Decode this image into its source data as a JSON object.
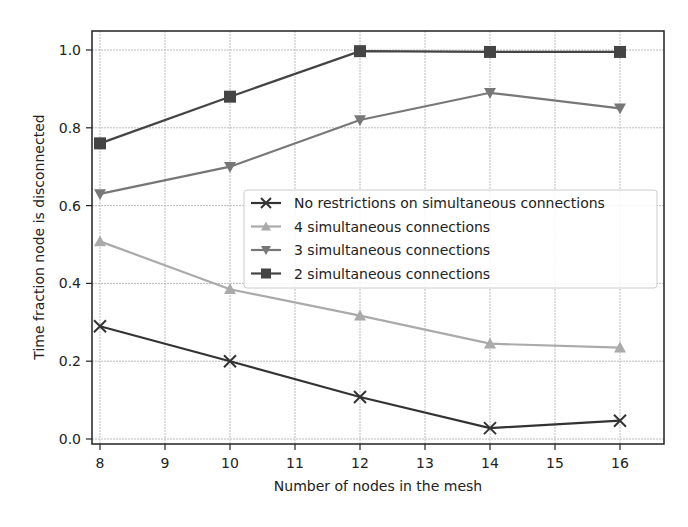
{
  "chart_data": {
    "type": "line",
    "title": "",
    "xlabel": "Number of nodes in the mesh",
    "ylabel": "Time fraction node is disconnected",
    "x": [
      8,
      10,
      12,
      14,
      16
    ],
    "xlim": [
      7.85,
      16.8
    ],
    "ylim": [
      -0.015,
      1.05
    ],
    "xticks": [
      8,
      9,
      10,
      11,
      12,
      13,
      14,
      15,
      16
    ],
    "yticks": [
      0.0,
      0.2,
      0.4,
      0.6,
      0.8,
      1.0
    ],
    "xtick_labels": [
      "8",
      "9",
      "10",
      "11",
      "12",
      "13",
      "14",
      "15",
      "16"
    ],
    "ytick_labels": [
      "0.0",
      "0.2",
      "0.4",
      "0.6",
      "0.8",
      "1.0"
    ],
    "grid": true,
    "legend_position": "center right",
    "series": [
      {
        "name": "No restrictions on simultaneous connections",
        "marker": "x",
        "color": "#333333",
        "values": [
          0.29,
          0.2,
          0.108,
          0.028,
          0.047
        ]
      },
      {
        "name": "4 simultaneous connections",
        "marker": "triangle-up",
        "color": "#aaaaaa",
        "values": [
          0.508,
          0.385,
          0.317,
          0.245,
          0.235
        ]
      },
      {
        "name": "3 simultaneous connections",
        "marker": "triangle-down",
        "color": "#777777",
        "values": [
          0.63,
          0.7,
          0.82,
          0.89,
          0.85
        ]
      },
      {
        "name": "2 simultaneous connections",
        "marker": "square",
        "color": "#444444",
        "values": [
          0.76,
          0.88,
          0.997,
          0.995,
          0.995
        ]
      }
    ]
  }
}
